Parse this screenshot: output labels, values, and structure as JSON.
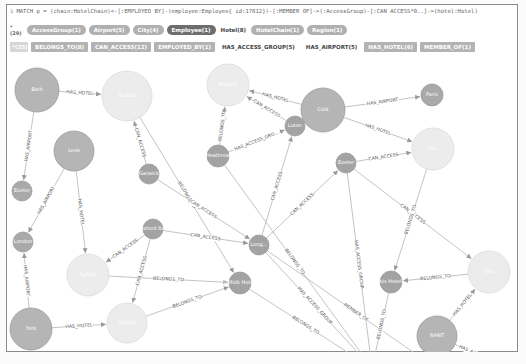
{
  "query": {
    "marker": "$",
    "text": "MATCH p = (chain:HotelChain)<-[:EMPLOYED_BY]-(employee:Employee{_id:17812})-[:MEMBER_OF]->(:AccessGroup)-[:CAN_ACCESS*0..]->(hotel:Hotel)"
  },
  "node_labels": {
    "count": "*(29)",
    "items": [
      {
        "label": "AccessGroup(1)",
        "style": "pill"
      },
      {
        "label": "Airport(5)",
        "style": "pill"
      },
      {
        "label": "City(4)",
        "style": "pill"
      },
      {
        "label": "Employee(1)",
        "style": "dark"
      },
      {
        "label": "Hotel(8)",
        "style": "plain"
      },
      {
        "label": "HotelChain(1)",
        "style": "pill"
      },
      {
        "label": "Region(1)",
        "style": "pill"
      }
    ]
  },
  "relationship_types": {
    "count": "*(35)",
    "items": [
      {
        "label": "BELONGS_TO(8)",
        "style": "rel"
      },
      {
        "label": "CAN_ACCESS(12)",
        "style": "rel"
      },
      {
        "label": "EMPLOYED_BY(1)",
        "style": "rel"
      },
      {
        "label": "HAS_ACCESS_GROUP(5)",
        "style": "plain"
      },
      {
        "label": "HAS_AIRPORT(5)",
        "style": "plain"
      },
      {
        "label": "HAS_HOTEL(6)",
        "style": "rel"
      },
      {
        "label": "MEMBER_OF(1)",
        "style": "rel"
      }
    ]
  },
  "graph": {
    "colors": {
      "city": "#b5b5b5",
      "hotel": "#ececec",
      "airport": "#a9a9a9",
      "group": "#a3a3a3",
      "employee": "#6a6a6a",
      "edge": "#c4c4c4"
    },
    "nodes": [
      {
        "id": "n1",
        "label": "Bath",
        "x": 30,
        "y": 34,
        "r": 22,
        "type": "city"
      },
      {
        "id": "n2",
        "label": "Suffolk",
        "x": 120,
        "y": 40,
        "r": 25,
        "type": "hotel"
      },
      {
        "id": "n3",
        "label": "Novotel",
        "x": 221,
        "y": 29,
        "r": 21,
        "type": "hotel"
      },
      {
        "id": "n4",
        "label": "Cork",
        "x": 316,
        "y": 54,
        "r": 22,
        "type": "city"
      },
      {
        "id": "n5",
        "label": "Paris",
        "x": 425,
        "y": 39,
        "r": 11,
        "type": "airport"
      },
      {
        "id": "n6",
        "label": "Exeter",
        "x": 15,
        "y": 135,
        "r": 10,
        "type": "airport"
      },
      {
        "id": "n7",
        "label": "Leek",
        "x": 67,
        "y": 95,
        "r": 20,
        "type": "city"
      },
      {
        "id": "n8",
        "label": "Gatwick",
        "x": 142,
        "y": 118,
        "r": 10,
        "type": "group"
      },
      {
        "id": "n9",
        "label": "Luton",
        "x": 288,
        "y": 70,
        "r": 10,
        "type": "group"
      },
      {
        "id": "n10",
        "label": "Heathrow",
        "x": 211,
        "y": 100,
        "r": 11,
        "type": "group"
      },
      {
        "id": "n11",
        "label": "Exeter",
        "x": 339,
        "y": 107,
        "r": 10,
        "type": "group"
      },
      {
        "id": "n12",
        "label": "Ibis",
        "x": 426,
        "y": 93,
        "r": 21,
        "type": "hotel"
      },
      {
        "id": "n13",
        "label": "London",
        "x": 16,
        "y": 186,
        "r": 10,
        "type": "airport"
      },
      {
        "id": "n14",
        "label": "Suffolk",
        "x": 81,
        "y": 219,
        "r": 21,
        "type": "hotel"
      },
      {
        "id": "n15",
        "label": "Oxford Ibis",
        "x": 146,
        "y": 173,
        "r": 10,
        "type": "group"
      },
      {
        "id": "n16",
        "label": "Long...",
        "x": 252,
        "y": 189,
        "r": 10,
        "type": "group"
      },
      {
        "id": "n17",
        "label": "Suffolk Hotels",
        "x": 233,
        "y": 227,
        "r": 11,
        "type": "group"
      },
      {
        "id": "n18",
        "label": "Ibis Hotels",
        "x": 384,
        "y": 226,
        "r": 11,
        "type": "group"
      },
      {
        "id": "n19",
        "label": "Ibis",
        "x": 482,
        "y": 216,
        "r": 21,
        "type": "hotel"
      },
      {
        "id": "n20",
        "label": "NANT",
        "x": 430,
        "y": 280,
        "r": 20,
        "type": "city"
      },
      {
        "id": "n21",
        "label": "York",
        "x": 24,
        "y": 273,
        "r": 21,
        "type": "city"
      },
      {
        "id": "n22",
        "label": "Suffolk",
        "x": 120,
        "y": 267,
        "r": 20,
        "type": "hotel"
      },
      {
        "id": "n23",
        "label": "Avoca Hotels",
        "x": 365,
        "y": 312,
        "r": 11,
        "type": "group"
      },
      {
        "id": "n24",
        "label": "Jeoffrey Fraser",
        "x": 449,
        "y": 326,
        "r": 13,
        "type": "employee"
      },
      {
        "id": "n25",
        "label": "Dublin",
        "x": 495,
        "y": 310,
        "r": 10,
        "type": "airport"
      }
    ],
    "edges": [
      {
        "from": "n1",
        "to": "n2",
        "label": "HAS_HOTEL"
      },
      {
        "from": "n1",
        "to": "n6",
        "label": "HAS_AIRPORT"
      },
      {
        "from": "n4",
        "to": "n3",
        "label": "HAS_HOTEL"
      },
      {
        "from": "n4",
        "to": "n5",
        "label": "HAS_AIRPORT"
      },
      {
        "from": "n4",
        "to": "n12",
        "label": "HAS_HOTEL"
      },
      {
        "from": "n7",
        "to": "n13",
        "label": "HAS_AIRPORT"
      },
      {
        "from": "n7",
        "to": "n14",
        "label": "HAS_HOTEL"
      },
      {
        "from": "n8",
        "to": "n2",
        "label": "CAN_ACCESS"
      },
      {
        "from": "n10",
        "to": "n3",
        "label": "BELONGS_TO"
      },
      {
        "from": "n10",
        "to": "n9",
        "label": "HAS_ACCESS_GRO..."
      },
      {
        "from": "n9",
        "to": "n3",
        "label": "CAN_ACCESS"
      },
      {
        "from": "n16",
        "to": "n9",
        "label": "CAN_ACCESS"
      },
      {
        "from": "n16",
        "to": "n11",
        "label": "CAN_ACCESS"
      },
      {
        "from": "n11",
        "to": "n12",
        "label": "CAN_ACCESS"
      },
      {
        "from": "n11",
        "to": "n19",
        "label": "CAN_ACCESS"
      },
      {
        "from": "n2",
        "to": "n17",
        "label": "BELONGS_TO"
      },
      {
        "from": "n8",
        "to": "n16",
        "label": "CAN_ACCESS"
      },
      {
        "from": "n15",
        "to": "n16",
        "label": "CAN_ACCESS"
      },
      {
        "from": "n15",
        "to": "n14",
        "label": "CAN_ACCESS"
      },
      {
        "from": "n15",
        "to": "n22",
        "label": "CAN_ACCESS"
      },
      {
        "from": "n14",
        "to": "n17",
        "label": "BELONGS_TO"
      },
      {
        "from": "n22",
        "to": "n17",
        "label": "BELONGS_TO"
      },
      {
        "from": "n17",
        "to": "n23",
        "label": "BELONGS_TO"
      },
      {
        "from": "n10",
        "to": "n23",
        "label": "BELONGS_TO"
      },
      {
        "from": "n16",
        "to": "n23",
        "label": "HAS_ACCESS_GROUP"
      },
      {
        "from": "n16",
        "to": "n24",
        "label": "MEMBER_OF"
      },
      {
        "from": "n12",
        "to": "n18",
        "label": "BELONGS_TO"
      },
      {
        "from": "n19",
        "to": "n18",
        "label": "BELONGS_TO"
      },
      {
        "from": "n18",
        "to": "n23",
        "label": "BELONGS_TO"
      },
      {
        "from": "n20",
        "to": "n19",
        "label": "HAS_HOTEL"
      },
      {
        "from": "n20",
        "to": "n25",
        "label": "HAS_AIRPORT"
      },
      {
        "from": "n21",
        "to": "n22",
        "label": "HAS_HOTEL"
      },
      {
        "from": "n21",
        "to": "n13",
        "label": "HAS_AIRPORT"
      },
      {
        "from": "n24",
        "to": "n23",
        "label": "EMPLOYED_BY"
      },
      {
        "from": "n11",
        "to": "n23",
        "label": "HAS_ACCESS_GROUP"
      }
    ]
  }
}
